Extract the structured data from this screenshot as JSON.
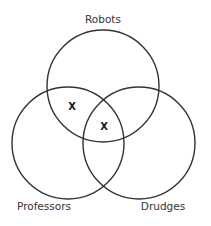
{
  "diagram": {
    "type": "venn",
    "sets": [
      {
        "id": "robots",
        "label": "Robots",
        "cx": 103,
        "cy": 86,
        "r": 56,
        "label_x": 103,
        "label_y": 23
      },
      {
        "id": "professors",
        "label": "Professors",
        "cx": 68,
        "cy": 143,
        "r": 56,
        "label_x": 44,
        "label_y": 210
      },
      {
        "id": "drudges",
        "label": "Drudges",
        "cx": 139,
        "cy": 143,
        "r": 56,
        "label_x": 163,
        "label_y": 210
      }
    ],
    "marks": [
      {
        "region": "robots-and-professors-only",
        "label": "X",
        "x": 72,
        "y": 110
      },
      {
        "region": "robots-and-professors-and-drudges",
        "label": "X",
        "x": 104,
        "y": 130
      }
    ],
    "colors": {
      "stroke": "#333333",
      "text": "#333333",
      "background": "#ffffff"
    }
  }
}
